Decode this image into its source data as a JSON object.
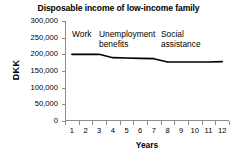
{
  "chart_data": {
    "type": "line",
    "title": "Disposable income of low-income family",
    "xlabel": "Years",
    "ylabel": "DKK",
    "x": [
      1,
      2,
      3,
      4,
      5,
      6,
      7,
      8,
      9,
      10,
      11,
      12
    ],
    "values": [
      200000,
      200000,
      200000,
      190000,
      189000,
      188000,
      187000,
      177000,
      177000,
      177000,
      177000,
      178000
    ],
    "series": [
      {
        "name": "Disposable income",
        "values": [
          200000,
          200000,
          200000,
          190000,
          189000,
          188000,
          187000,
          177000,
          177000,
          177000,
          177000,
          178000
        ]
      }
    ],
    "xtick_labels": [
      "1",
      "2",
      "3",
      "4",
      "5",
      "6",
      "7",
      "8",
      "9",
      "10",
      "11",
      "12"
    ],
    "ytick_labels": [
      "300,000",
      "250,000",
      "200,000",
      "150,000",
      "100,000",
      "50,000",
      "0"
    ],
    "ytick_values": [
      300000,
      250000,
      200000,
      150000,
      100000,
      50000,
      0
    ],
    "ylim": [
      0,
      300000
    ],
    "xlim": [
      1,
      12
    ],
    "grid": false,
    "legend": "none",
    "line_color": "#000000",
    "background_color": "#ffffff",
    "axis_color": "#8c8c8c",
    "annotations": [
      {
        "text": "Work",
        "x_start": 1,
        "x_end": 3
      },
      {
        "text": "Unemployment\nbenefits",
        "x_start": 4,
        "x_end": 7
      },
      {
        "text": "Social\nassistance",
        "x_start": 8,
        "x_end": 12
      }
    ]
  }
}
